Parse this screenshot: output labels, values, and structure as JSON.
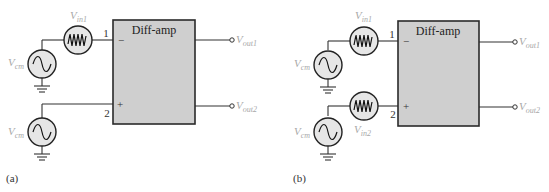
{
  "figure": {
    "panels": [
      {
        "id": "a",
        "caption": "(a)",
        "block_label": "Diff-amp",
        "inverting_pin": "1",
        "noninverting_pin": "2",
        "inverting_sign": "−",
        "noninverting_sign": "+",
        "sources": {
          "vin1": {
            "main": "V",
            "sub": "in1"
          },
          "vcm_top": {
            "main": "V",
            "sub": "cm"
          },
          "vcm_bottom": {
            "main": "V",
            "sub": "cm"
          }
        },
        "outputs": {
          "out1": {
            "main": "V",
            "sub": "out1"
          },
          "out2": {
            "main": "V",
            "sub": "out2"
          }
        }
      },
      {
        "id": "b",
        "caption": "(b)",
        "block_label": "Diff-amp",
        "inverting_pin": "1",
        "noninverting_pin": "2",
        "inverting_sign": "−",
        "noninverting_sign": "+",
        "sources": {
          "vin1": {
            "main": "V",
            "sub": "in1"
          },
          "vin2": {
            "main": "V",
            "sub": "in2"
          },
          "vcm_top": {
            "main": "V",
            "sub": "cm"
          },
          "vcm_bottom": {
            "main": "V",
            "sub": "cm"
          }
        },
        "outputs": {
          "out1": {
            "main": "V",
            "sub": "out1"
          },
          "out2": {
            "main": "V",
            "sub": "out2"
          }
        }
      }
    ],
    "colors": {
      "block_fill": "#cfcfcf",
      "source_fill": "#e6e6e6",
      "label_gray": "#a8a8a8",
      "line": "#333333"
    }
  }
}
